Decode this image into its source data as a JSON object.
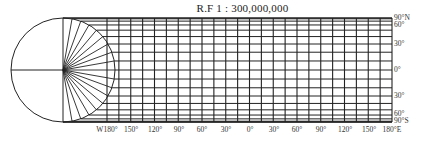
{
  "title": "R.F 1 : 300,000,000",
  "diagram": {
    "type": "cylindrical projection construction",
    "grid_color": "#222222",
    "circle": {
      "cx": 63,
      "cy": 70,
      "r": 52
    },
    "grid": {
      "x_left": 107,
      "x_right": 392,
      "y_top": 18,
      "y_bottom": 122,
      "lon_step_deg": 15
    },
    "latitude_labels": [
      {
        "text": "90°N",
        "y": 18
      },
      {
        "text": "60°",
        "y": 25
      },
      {
        "text": "30°",
        "y": 44
      },
      {
        "text": "0°",
        "y": 70
      },
      {
        "text": "30°",
        "y": 96
      },
      {
        "text": "60°",
        "y": 114
      },
      {
        "text": "90°S",
        "y": 121
      }
    ],
    "longitude_labels": [
      {
        "text": "W180°",
        "x": 107
      },
      {
        "text": "150°",
        "x": 131
      },
      {
        "text": "120°",
        "x": 155
      },
      {
        "text": "90°",
        "x": 179
      },
      {
        "text": "60°",
        "x": 202
      },
      {
        "text": "30°",
        "x": 226
      },
      {
        "text": "0°",
        "x": 250
      },
      {
        "text": "30°",
        "x": 274
      },
      {
        "text": "60°",
        "x": 297
      },
      {
        "text": "90°",
        "x": 321
      },
      {
        "text": "120°",
        "x": 345
      },
      {
        "text": "150°",
        "x": 369
      },
      {
        "text": "180°E",
        "x": 392
      }
    ]
  }
}
